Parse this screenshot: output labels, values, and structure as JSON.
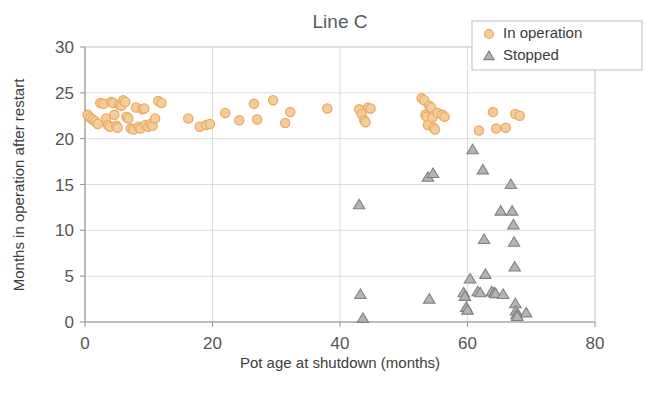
{
  "chart_data": {
    "type": "scatter",
    "title": "Line C",
    "xlabel": "Pot age at shutdown  (months)",
    "ylabel": "Months in operation after restart",
    "xlim": [
      0,
      80
    ],
    "ylim": [
      0,
      30
    ],
    "xticks": [
      0,
      20,
      40,
      60,
      80
    ],
    "yticks": [
      0,
      5,
      10,
      15,
      20,
      25,
      30
    ],
    "grid": "horizontal-and-vertical-light",
    "legend_position": "top-right",
    "series": [
      {
        "name": "In operation",
        "marker": "circle",
        "color": "#edaa63",
        "fill": "#f5cd9a",
        "points": [
          [
            0.4,
            22.6
          ],
          [
            0.8,
            22.3
          ],
          [
            1.2,
            22.1
          ],
          [
            1.6,
            21.9
          ],
          [
            2.0,
            21.6
          ],
          [
            2.4,
            23.9
          ],
          [
            2.9,
            23.8
          ],
          [
            3.3,
            22.2
          ],
          [
            3.6,
            21.5
          ],
          [
            3.9,
            21.3
          ],
          [
            4.1,
            24.0
          ],
          [
            4.4,
            23.9
          ],
          [
            4.6,
            22.6
          ],
          [
            4.9,
            21.4
          ],
          [
            5.1,
            21.2
          ],
          [
            5.4,
            23.7
          ],
          [
            5.7,
            23.6
          ],
          [
            6.0,
            24.2
          ],
          [
            6.3,
            24.0
          ],
          [
            6.5,
            22.4
          ],
          [
            6.8,
            22.2
          ],
          [
            7.2,
            21.1
          ],
          [
            7.6,
            21.0
          ],
          [
            8.0,
            23.4
          ],
          [
            8.4,
            21.3
          ],
          [
            8.7,
            21.1
          ],
          [
            9.0,
            23.2
          ],
          [
            9.3,
            23.3
          ],
          [
            9.5,
            21.5
          ],
          [
            9.9,
            21.3
          ],
          [
            10.3,
            21.6
          ],
          [
            10.6,
            21.4
          ],
          [
            11.0,
            22.2
          ],
          [
            11.5,
            24.1
          ],
          [
            12.0,
            23.9
          ],
          [
            16.2,
            22.2
          ],
          [
            18.0,
            21.3
          ],
          [
            19.0,
            21.5
          ],
          [
            19.6,
            21.6
          ],
          [
            22.0,
            22.8
          ],
          [
            24.2,
            22.0
          ],
          [
            26.5,
            23.8
          ],
          [
            27.0,
            22.1
          ],
          [
            29.5,
            24.2
          ],
          [
            31.4,
            21.7
          ],
          [
            32.2,
            22.9
          ],
          [
            38.0,
            23.3
          ],
          [
            43.0,
            23.2
          ],
          [
            43.4,
            22.7
          ],
          [
            43.8,
            22.0
          ],
          [
            44.0,
            21.8
          ],
          [
            44.4,
            23.4
          ],
          [
            44.8,
            23.3
          ],
          [
            52.8,
            24.4
          ],
          [
            53.2,
            24.2
          ],
          [
            53.4,
            22.6
          ],
          [
            53.6,
            22.4
          ],
          [
            53.8,
            21.5
          ],
          [
            54.0,
            23.6
          ],
          [
            54.3,
            23.4
          ],
          [
            54.5,
            22.3
          ],
          [
            54.7,
            21.2
          ],
          [
            54.9,
            21.0
          ],
          [
            55.3,
            22.8
          ],
          [
            56.0,
            22.6
          ],
          [
            56.4,
            22.4
          ],
          [
            61.8,
            20.9
          ],
          [
            64.0,
            22.9
          ],
          [
            64.5,
            21.1
          ],
          [
            66.0,
            21.2
          ],
          [
            67.5,
            22.7
          ],
          [
            68.2,
            22.5
          ]
        ]
      },
      {
        "name": "Stopped",
        "marker": "triangle",
        "color": "#808080",
        "fill": "#b4b4b4",
        "points": [
          [
            43.0,
            12.8
          ],
          [
            43.2,
            3.0
          ],
          [
            43.6,
            0.4
          ],
          [
            53.8,
            15.8
          ],
          [
            54.6,
            16.2
          ],
          [
            54.0,
            2.5
          ],
          [
            59.4,
            3.2
          ],
          [
            59.6,
            2.8
          ],
          [
            59.8,
            1.6
          ],
          [
            60.0,
            1.3
          ],
          [
            60.4,
            4.7
          ],
          [
            60.8,
            18.8
          ],
          [
            61.6,
            3.3
          ],
          [
            62.0,
            3.2
          ],
          [
            62.4,
            16.6
          ],
          [
            62.6,
            9.0
          ],
          [
            62.8,
            5.2
          ],
          [
            63.8,
            3.3
          ],
          [
            64.2,
            3.2
          ],
          [
            64.4,
            3.1
          ],
          [
            65.2,
            12.1
          ],
          [
            65.6,
            3.0
          ],
          [
            66.8,
            15.0
          ],
          [
            67.0,
            12.1
          ],
          [
            67.2,
            10.6
          ],
          [
            67.3,
            8.7
          ],
          [
            67.4,
            6.0
          ],
          [
            67.5,
            2.0
          ],
          [
            67.6,
            1.2
          ],
          [
            67.7,
            0.8
          ],
          [
            67.8,
            0.6
          ],
          [
            69.2,
            1.0
          ]
        ]
      }
    ]
  },
  "legend": {
    "entries": [
      {
        "label": "In operation",
        "marker": "circle-orange"
      },
      {
        "label": "Stopped",
        "marker": "triangle-gray"
      }
    ]
  },
  "colors": {
    "in_operation_stroke": "#edaa63",
    "in_operation_fill": "#f5cd9a",
    "stopped_stroke": "#808080",
    "stopped_fill": "#b4b4b4",
    "grid": "#d9d9d9",
    "axis": "#9a9a9a",
    "text": "#3d3d3d",
    "title_text": "#5a5a5a"
  }
}
